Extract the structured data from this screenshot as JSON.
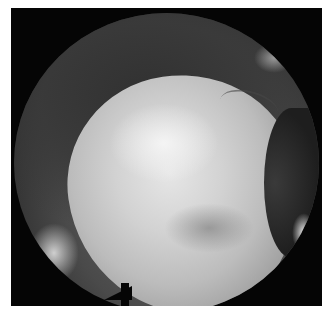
{
  "image": {
    "description": "Circular arthroscopic/endoscopic grayscale view showing a large pale rounded tissue mass within a dark joint cavity",
    "colors": {
      "border": "#ffffff",
      "background": "#050505",
      "tissue_light": "#e6e6e6",
      "tissue_dark": "#2a2a2a"
    }
  }
}
